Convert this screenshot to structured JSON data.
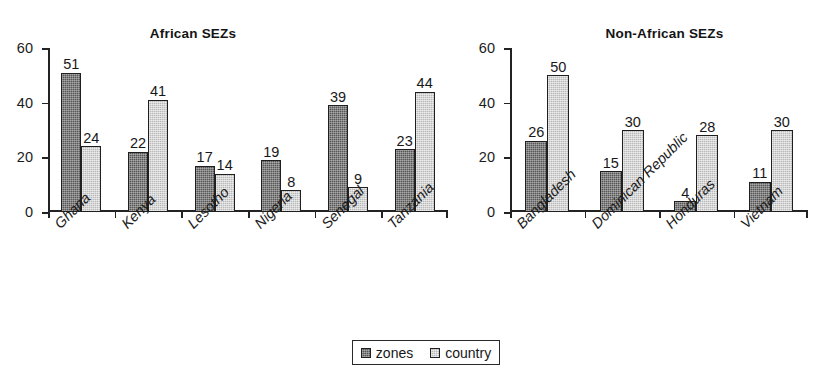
{
  "figure": {
    "clipped_heading": "",
    "legend": {
      "entries": [
        {
          "label": "zones",
          "color": "#565656"
        },
        {
          "label": "country",
          "color": "#b9b9b9"
        }
      ]
    }
  },
  "chart_data": [
    {
      "type": "bar",
      "title": "African SEZs",
      "xlabel": "",
      "ylabel": "",
      "ylim": [
        0,
        60
      ],
      "yticks": [
        0,
        20,
        40,
        60
      ],
      "grid": false,
      "legend_position": "bottom-center-shared",
      "categories": [
        "Ghana",
        "Kenya",
        "Lesotho",
        "Nigeria",
        "Senegal",
        "Tanzania"
      ],
      "series": [
        {
          "name": "zones",
          "color": "#565656",
          "values": [
            51,
            22,
            17,
            19,
            39,
            23
          ]
        },
        {
          "name": "country",
          "color": "#b9b9b9",
          "values": [
            24,
            41,
            14,
            8,
            9,
            44
          ]
        }
      ]
    },
    {
      "type": "bar",
      "title": "Non-African SEZs",
      "xlabel": "",
      "ylabel": "",
      "ylim": [
        0,
        60
      ],
      "yticks": [
        0,
        20,
        40,
        60
      ],
      "grid": false,
      "legend_position": "bottom-center-shared",
      "categories": [
        "Bangladesh",
        "Dominican Republic",
        "Honduras",
        "Vietnam"
      ],
      "series": [
        {
          "name": "zones",
          "color": "#565656",
          "values": [
            26,
            15,
            4,
            11
          ]
        },
        {
          "name": "country",
          "color": "#b9b9b9",
          "values": [
            50,
            30,
            28,
            30
          ]
        }
      ]
    }
  ]
}
